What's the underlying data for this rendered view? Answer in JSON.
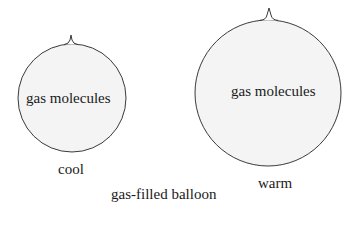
{
  "diagram": {
    "title": "gas-filled balloon",
    "balloons": [
      {
        "state": "cool",
        "inner_label": "gas molecules",
        "cx": 72,
        "cy": 98,
        "r": 54,
        "knot_tip": [
          71,
          35
        ]
      },
      {
        "state": "warm",
        "inner_label": "gas molecules",
        "cx": 268,
        "cy": 93,
        "r": 73,
        "knot_tip": [
          269,
          8
        ]
      }
    ],
    "colors": {
      "fill": "#f4f4f4",
      "stroke": "#3a3a3a",
      "text": "#1a1a1a"
    }
  }
}
